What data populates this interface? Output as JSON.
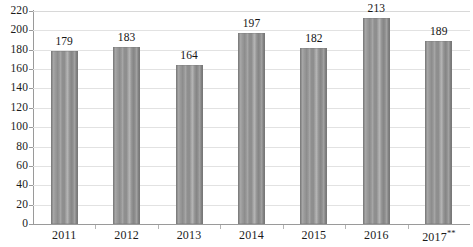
{
  "chart_data": {
    "type": "bar",
    "title": "",
    "subtitle": "",
    "xlabel": "",
    "ylabel": "",
    "categories": [
      "2011",
      "2012",
      "2013",
      "2014",
      "2015",
      "2016",
      "2017**"
    ],
    "values": [
      179,
      183,
      164,
      197,
      182,
      213,
      189
    ],
    "data_labels": [
      "179",
      "183",
      "164",
      "197",
      "182",
      "213",
      "189"
    ],
    "ylim": [
      0,
      220
    ],
    "ytick_step": 20,
    "ytick_labels": [
      "0",
      "20",
      "40",
      "60",
      "80",
      "100",
      "120",
      "140",
      "160",
      "180",
      "200",
      "220"
    ],
    "ytick_values": [
      0,
      20,
      40,
      60,
      80,
      100,
      120,
      140,
      160,
      180,
      200,
      220
    ],
    "grid": true,
    "grid_axis": "y",
    "legend": false,
    "legend_position": "none",
    "series": [
      {
        "name": "",
        "values": [
          179,
          183,
          164,
          197,
          182,
          213,
          189
        ]
      }
    ],
    "annotations": [
      {
        "text": "**",
        "attached_to": "2017",
        "meaning": "footnote marker on last category label"
      }
    ],
    "colors": {
      "bar_fill": "#8e8e8e",
      "bar_fill_light": "#a0a0a0",
      "bar_fill_dark": "#7c7c7c",
      "gridline": "#e2e2e2",
      "axis_line": "#9a9a9a",
      "text": "#1b1b1b",
      "background": "#ffffff"
    },
    "bar_style": "vertical-striped-gray"
  }
}
